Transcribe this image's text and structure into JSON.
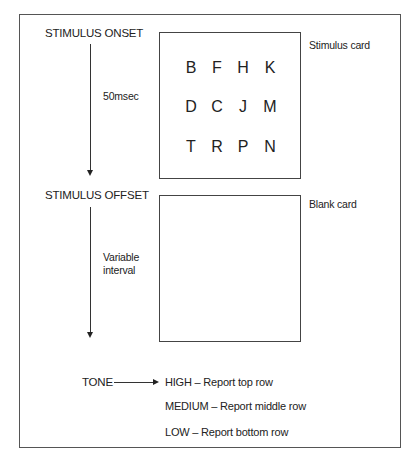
{
  "diagram": {
    "onset_label": "STIMULUS ONSET",
    "offset_label": "STIMULUS OFFSET",
    "onset_duration": "50msec",
    "offset_duration_line1": "Variable",
    "offset_duration_line2": "interval",
    "stimulus_card_label": "Stimulus card",
    "blank_card_label": "Blank card",
    "stimulus_grid": [
      [
        "B",
        "F",
        "H",
        "K"
      ],
      [
        "D",
        "C",
        "J",
        "M"
      ],
      [
        "T",
        "R",
        "P",
        "N"
      ]
    ],
    "tone_label": "TONE",
    "tone_options": [
      "HIGH – Report top row",
      "MEDIUM – Report middle row",
      "LOW – Report bottom row"
    ]
  }
}
